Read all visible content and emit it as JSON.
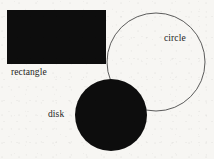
{
  "figure": {
    "background_color": "#f7f6f3",
    "ink_color": "#0d0d0d",
    "outline_color": "#4a4a4a",
    "width": 214,
    "height": 159,
    "shapes": [
      {
        "id": "rectangle",
        "kind": "rectangle",
        "label": "rectangle",
        "fill": "#0d0d0d",
        "stroke": "none",
        "x": 7,
        "y": 10,
        "width": 99,
        "height": 54,
        "label_x": 11,
        "label_y": 68
      },
      {
        "id": "circle",
        "kind": "circle-outline",
        "label": "circle",
        "fill": "none",
        "stroke": "#4a4a4a",
        "stroke_width": 0.9,
        "cx": 156,
        "cy": 62,
        "r": 49,
        "label_x": 164,
        "label_y": 34
      },
      {
        "id": "disk",
        "kind": "disk",
        "label": "disk",
        "fill": "#0d0d0d",
        "stroke": "none",
        "cx": 111,
        "cy": 115,
        "r": 36,
        "label_x": 48,
        "label_y": 110
      }
    ]
  }
}
